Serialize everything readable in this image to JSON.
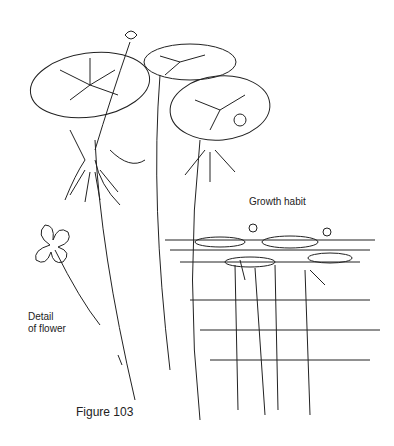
{
  "labels": {
    "growth_habit": "Growth habit",
    "detail_line1": "Detail",
    "detail_line2": "of flower",
    "figure": "Figure 103"
  },
  "colors": {
    "ink": "#222222",
    "background": "#ffffff"
  }
}
